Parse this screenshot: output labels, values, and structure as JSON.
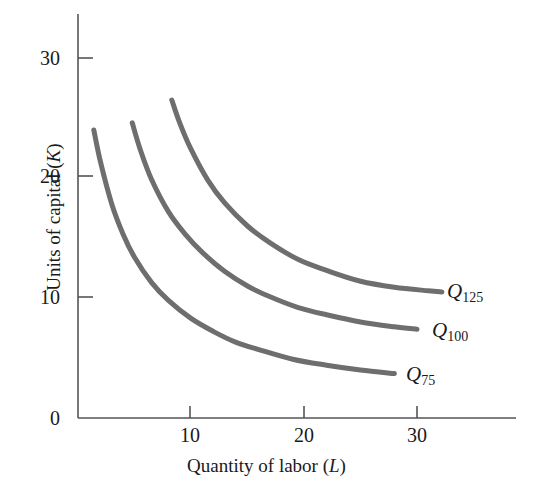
{
  "figure": {
    "type": "isoquant-map",
    "width": 533,
    "height": 489,
    "background": "#ffffff"
  },
  "axes": {
    "x_title_prefix": "Quantity of labor (",
    "x_title_var": "L",
    "x_title_suffix": ")",
    "y_title_prefix": "Units of capital (",
    "y_title_var": "K",
    "y_title_suffix": ")",
    "x_ticks": [
      "10",
      "20",
      "30"
    ],
    "y_ticks": [
      "0",
      "10",
      "20",
      "30"
    ],
    "axis_color": "#555555",
    "axis_width": 1.6
  },
  "labels": {
    "q125": {
      "symbol": "Q",
      "subscript": "125"
    },
    "q100": {
      "symbol": "Q",
      "subscript": "100"
    },
    "q75": {
      "symbol": "Q",
      "subscript": "75"
    }
  },
  "chart_data": {
    "type": "line",
    "title": "",
    "subtitle": "",
    "xlabel": "Quantity of labor (L)",
    "ylabel": "Units of capital (K)",
    "xlim": [
      0,
      37
    ],
    "ylim": [
      0,
      33
    ],
    "xticks": [
      10,
      20,
      30
    ],
    "yticks": [
      0,
      10,
      20,
      30
    ],
    "grid": false,
    "legend_position": "right-of-curve-ends",
    "annotations": [
      "Q_125",
      "Q_100",
      "Q_75"
    ],
    "curve_color": "#6e6e6e",
    "curve_width": 5,
    "series": [
      {
        "name": "Q_75",
        "label": "Q75",
        "output_level": 75,
        "x": [
          1.4,
          2.0,
          3.0,
          4.0,
          5.0,
          6.5,
          8.0,
          10.0,
          12.0,
          14.0,
          16.0,
          19.0,
          22.0,
          25.0,
          28.0
        ],
        "y": [
          24.0,
          21.3,
          17.8,
          15.3,
          13.4,
          11.3,
          9.8,
          8.3,
          7.2,
          6.3,
          5.7,
          4.9,
          4.4,
          4.0,
          3.7
        ]
      },
      {
        "name": "Q_100",
        "label": "Q100",
        "output_level": 100,
        "x": [
          4.8,
          5.5,
          6.5,
          8.0,
          9.5,
          11.0,
          13.0,
          15.0,
          17.0,
          19.5,
          22.0,
          25.0,
          28.0,
          30.0
        ],
        "y": [
          24.6,
          22.4,
          19.9,
          17.2,
          15.3,
          13.8,
          12.2,
          11.0,
          10.1,
          9.2,
          8.6,
          8.0,
          7.6,
          7.4
        ]
      },
      {
        "name": "Q_125",
        "label": "Q125",
        "output_level": 125,
        "x": [
          8.3,
          9.0,
          10.0,
          11.5,
          13.0,
          15.0,
          17.0,
          19.5,
          22.0,
          25.0,
          28.0,
          31.0,
          32.2
        ],
        "y": [
          26.5,
          24.6,
          22.4,
          19.8,
          17.9,
          16.0,
          14.6,
          13.2,
          12.3,
          11.4,
          10.9,
          10.6,
          10.5
        ]
      }
    ]
  }
}
